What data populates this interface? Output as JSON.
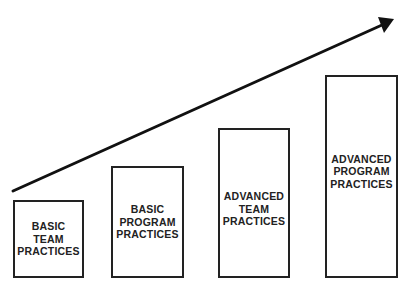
{
  "diagram": {
    "type": "maturity-progression",
    "arrow": {
      "direction": "up-right",
      "color": "#111111"
    },
    "stages": [
      {
        "label": "BASIC\nTEAM\nPRACTICES"
      },
      {
        "label": "BASIC\nPROGRAM\nPRACTICES"
      },
      {
        "label": "ADVANCED\nTEAM\nPRACTICES"
      },
      {
        "label": "ADVANCED\nPROGRAM\nPRACTICES"
      }
    ]
  }
}
